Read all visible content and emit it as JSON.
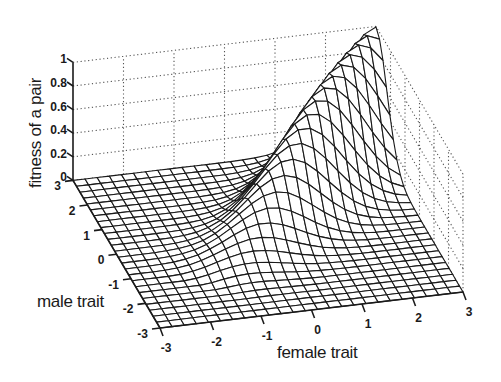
{
  "chart_data": {
    "type": "surface3d",
    "title": "",
    "xlabel": "female trait",
    "ylabel": "male trait",
    "zlabel": "fitness of a pair",
    "xlim": [
      -3,
      3
    ],
    "ylim": [
      -3,
      3
    ],
    "zlim": [
      0,
      1
    ],
    "xticks": [
      "-3",
      "-2",
      "-1",
      "0",
      "1",
      "2",
      "3"
    ],
    "yticks": [
      "-3",
      "-2",
      "-1",
      "0",
      "1",
      "2",
      "3"
    ],
    "zticks": [
      "0",
      "0.2",
      "0.4",
      "0.6",
      "0.8",
      "1"
    ],
    "grid": "dotted",
    "mesh_resolution": 25,
    "function": "z = sigmoid-like rise along diagonal times exp(-(male-female)^2)",
    "ridge": [
      {
        "female": -3,
        "male": -3,
        "fitness": 0.0
      },
      {
        "female": -2,
        "male": -2,
        "fitness": 0.02
      },
      {
        "female": -1,
        "male": -1,
        "fitness": 0.15
      },
      {
        "female": 0,
        "male": 0,
        "fitness": 0.4
      },
      {
        "female": 1,
        "male": 1,
        "fitness": 0.62
      },
      {
        "female": 2,
        "male": 2,
        "fitness": 0.82
      },
      {
        "female": 3,
        "male": 3,
        "fitness": 1.0
      }
    ]
  },
  "labels": {
    "z": "fitness of a pair",
    "male": "male trait",
    "female": "female trait"
  },
  "colors": {
    "ink": "#1a1a1a",
    "grid": "#555555",
    "background": "#ffffff"
  }
}
